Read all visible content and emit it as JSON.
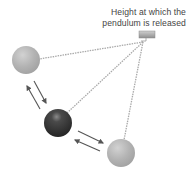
{
  "annotation": {
    "line1": "Height at which the",
    "line2": "pendulum is released"
  },
  "elements": {
    "pivot": "pivot-block",
    "balls": [
      "released-ball (light gray, left)",
      "lowest-point-ball (dark, middle)",
      "opposite-swing-ball (light gray, right)"
    ],
    "arrows": [
      "swing-down arrow",
      "swing-back arrow",
      "swing-up-right arrow",
      "return-left arrow"
    ]
  },
  "colors": {
    "light_ball": "#b5b5b5",
    "dark_ball": "#3a3a3a",
    "chain": "#a9a9a9",
    "arrow": "#555555",
    "text": "#444444"
  }
}
